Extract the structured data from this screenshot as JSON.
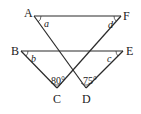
{
  "diagram": {
    "type": "geometry",
    "points": {
      "A": {
        "label": "A",
        "x": 34,
        "y": 16
      },
      "F": {
        "label": "F",
        "x": 121,
        "y": 16
      },
      "B": {
        "label": "B",
        "x": 21,
        "y": 51
      },
      "E": {
        "label": "E",
        "x": 123,
        "y": 51
      },
      "C": {
        "label": "C",
        "x": 57,
        "y": 88
      },
      "D": {
        "label": "D",
        "x": 86,
        "y": 88
      }
    },
    "segments": [
      "AF",
      "BE",
      "AD",
      "FC",
      "BC",
      "ED"
    ],
    "angles": {
      "a": {
        "label": "a",
        "vertex": "A"
      },
      "d": {
        "label": "d",
        "vertex": "F"
      },
      "b": {
        "label": "b",
        "vertex": "B"
      },
      "c": {
        "label": "c",
        "vertex": "E"
      },
      "C": {
        "label": "80°",
        "vertex": "C"
      },
      "D": {
        "label": "75°",
        "vertex": "D"
      }
    },
    "colors": {
      "stroke": "#2a2a2a",
      "background": "#ffffff"
    }
  }
}
